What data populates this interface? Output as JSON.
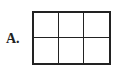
{
  "option": {
    "label": "A.",
    "grid": {
      "rows": 2,
      "columns": 3,
      "cells": [
        "",
        "",
        "",
        "",
        "",
        ""
      ]
    }
  }
}
